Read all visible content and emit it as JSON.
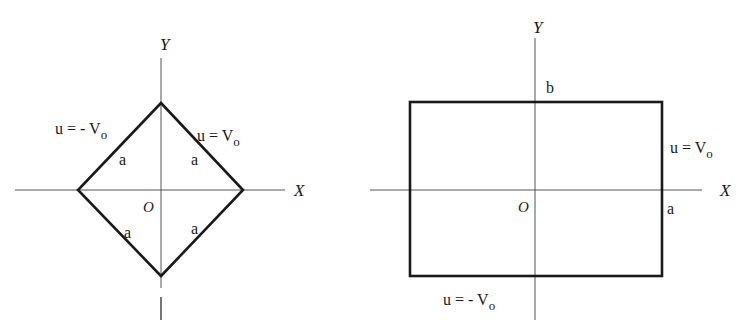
{
  "figures": [
    {
      "id": "diamond",
      "axes": {
        "x_label": "X",
        "y_label": "Y",
        "origin_label": "O"
      },
      "shape": "square rotated 45 degrees (diamond)",
      "boundary_labels": {
        "upper_left": "u = - V",
        "upper_left_sub": "o",
        "upper_right": "u = V",
        "upper_right_sub": "o"
      },
      "side_labels": [
        "a",
        "a",
        "a",
        "a"
      ]
    },
    {
      "id": "rectangle",
      "axes": {
        "x_label": "X",
        "y_label": "Y",
        "origin_label": "O"
      },
      "shape": "rectangle",
      "boundary_labels": {
        "right": "u = V",
        "right_sub": "o",
        "bottom": "u = - V",
        "bottom_sub": "o"
      },
      "dimension_labels": {
        "half_width": "a",
        "half_height": "b"
      }
    }
  ],
  "colors": {
    "line": "#1a1a1a",
    "axis": "#555555",
    "background": "#ffffff"
  }
}
